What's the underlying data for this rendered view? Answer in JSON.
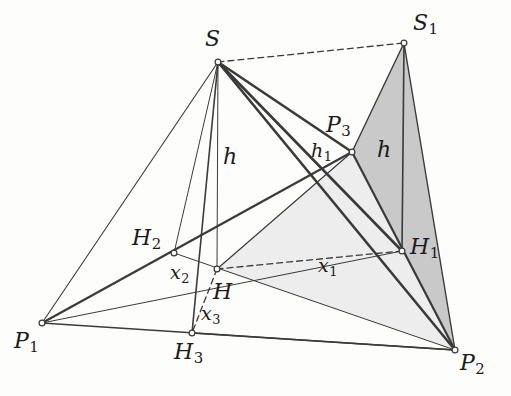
{
  "figure": {
    "background_color": "#fdfdfc",
    "ink_color": "#3a3a3a",
    "label_color": "#1b1b1b",
    "fill_light": "#ededed",
    "fill_dark": "#c9c9c9"
  },
  "points": {
    "S": {
      "label": "S",
      "sub": "",
      "x": 218,
      "y": 62,
      "label_x": 205,
      "label_y": 28
    },
    "S1": {
      "label": "S",
      "sub": "1",
      "x": 404,
      "y": 43,
      "label_x": 413,
      "label_y": 12
    },
    "P1": {
      "label": "P",
      "sub": "1",
      "x": 42,
      "y": 323,
      "label_x": 14,
      "label_y": 330
    },
    "P2": {
      "label": "P",
      "sub": "2",
      "x": 455,
      "y": 350,
      "label_x": 460,
      "label_y": 352
    },
    "P3": {
      "label": "P",
      "sub": "3",
      "x": 352,
      "y": 152,
      "label_x": 326,
      "label_y": 114
    },
    "H": {
      "label": "H",
      "sub": "",
      "x": 217,
      "y": 269,
      "label_x": 213,
      "label_y": 281
    },
    "H1": {
      "label": "H",
      "sub": "1",
      "x": 402,
      "y": 251,
      "label_x": 410,
      "label_y": 236
    },
    "H2": {
      "label": "H",
      "sub": "2",
      "x": 174,
      "y": 253,
      "label_x": 132,
      "label_y": 227
    },
    "H3": {
      "label": "H",
      "sub": "3",
      "x": 192,
      "y": 333,
      "label_x": 174,
      "label_y": 341
    }
  },
  "measure_labels": [
    {
      "name": "h",
      "label": "h",
      "sub": "",
      "x": 223,
      "y": 146,
      "size": "major",
      "describes": "altitude from S to H3"
    },
    {
      "name": "h-right",
      "label": "h",
      "sub": "",
      "x": 377,
      "y": 139,
      "size": "major",
      "describes": "altitude from S1 to H1"
    },
    {
      "name": "h1",
      "label": "h",
      "sub": "1",
      "x": 311,
      "y": 141,
      "size": "minor",
      "describes": "slant height from P3"
    },
    {
      "name": "x1",
      "label": "x",
      "sub": "1",
      "x": 318,
      "y": 256,
      "size": "minor",
      "describes": "distance H to H1"
    },
    {
      "name": "x2",
      "label": "x",
      "sub": "2",
      "x": 170,
      "y": 263,
      "size": "minor",
      "describes": "distance H to H2"
    },
    {
      "name": "x3",
      "label": "x",
      "sub": "3",
      "x": 201,
      "y": 304,
      "size": "minor",
      "describes": "distance H to H3"
    }
  ],
  "filled_regions": [
    {
      "name": "face-h-p3-p2",
      "fill": "#ededed",
      "points": "217,269 352,152 455,350"
    },
    {
      "name": "unfolded-face-s1-p3-p2",
      "fill": "#c9c9c9",
      "points": "404,43 352,152 455,350"
    }
  ],
  "solid_edges": [
    {
      "name": "edge-S-P1",
      "from": "S",
      "to": "P1",
      "width": 1.1
    },
    {
      "name": "edge-S-P2",
      "from": "S",
      "to": "P2",
      "width": 2.6
    },
    {
      "name": "edge-S-P3",
      "from": "S",
      "to": "P3",
      "width": 2.6
    },
    {
      "name": "edge-P1-P2",
      "from": "P1",
      "to": "P2",
      "width": 1.4
    },
    {
      "name": "edge-P1-P3",
      "from": "P1",
      "to": "P3",
      "width": 2.2
    },
    {
      "name": "edge-P2-P3",
      "from": "P2",
      "to": "P3",
      "width": 2.2
    },
    {
      "name": "edge-S1-P3",
      "from": "S1",
      "to": "P3",
      "width": 1.4
    },
    {
      "name": "edge-S1-P2",
      "from": "S1",
      "to": "P2",
      "width": 1.4
    },
    {
      "name": "altitude-S-H3",
      "from": "S",
      "to": "H3",
      "width": 1.6
    },
    {
      "name": "altitude-S1-H1",
      "from": "S1",
      "to": "H1",
      "width": 1.6
    },
    {
      "name": "cevian-S-H1",
      "from": "S",
      "to": "H1",
      "width": 2.6
    },
    {
      "name": "cevian-S-H2",
      "from": "S",
      "to": "H2",
      "width": 1.0
    },
    {
      "name": "cevian-S-H",
      "from": "S",
      "to": "H",
      "width": 1.0
    },
    {
      "name": "cevian-P1-H1",
      "from": "P1",
      "to": "H1",
      "width": 1.0
    },
    {
      "name": "cevian-P2-H2",
      "from": "P2",
      "to": "H2",
      "width": 1.0
    },
    {
      "name": "slant-P3-H",
      "from": "P3",
      "to": "H",
      "width": 1.2
    },
    {
      "name": "base-H3-P2",
      "from": "H3",
      "to": "P2",
      "width": 1.4
    }
  ],
  "dashed_edges": [
    {
      "name": "dashed-S-S1",
      "from": "S",
      "to": "S1",
      "width": 1.3
    },
    {
      "name": "dashed-H-H1",
      "from": "H",
      "to": "H1",
      "width": 1.3
    },
    {
      "name": "dashed-H-H3",
      "from": "H",
      "to": "H3",
      "width": 1.3
    }
  ],
  "vertex_markers": [
    "S",
    "S1",
    "P1",
    "P2",
    "P3",
    "H",
    "H1",
    "H2",
    "H3"
  ]
}
